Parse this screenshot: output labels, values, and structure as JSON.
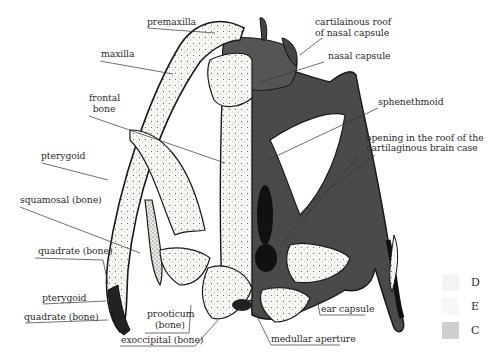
{
  "figure": {
    "type": "anatomical diagram"
  },
  "labels": {
    "premaxilla": "premaxilla",
    "maxilla": "maxilla",
    "frontal_bone_1": "frontal",
    "frontal_bone_2": "bone",
    "pterygoid_upper": "pterygoid",
    "squamosal": "squamosal (bone)",
    "quadrate_upper": "quadrate (bone)",
    "pterygoid_lower": "pterygoid",
    "quadrate_lower": "quadrate (bone)",
    "prooticum_1": "prooticum",
    "prooticum_2": "(bone)",
    "exoccipital": "exoccipital (bone)",
    "medullar_aperture": "medullar aperture",
    "ear_capsule": "ear capsule",
    "cartilaginous_roof_1": "cartilainous roof",
    "cartilaginous_roof_2": "of nasal capsule",
    "nasal_capsule": "nasal capsule",
    "sphenethmoid": "sphenethmoid",
    "opening_1": "opening in the roof of the",
    "opening_2": "cartilaginous brain case"
  },
  "legend": {
    "items": [
      {
        "label": "D",
        "color": "#f3f3f3"
      },
      {
        "label": "E",
        "color": "#f7f7f7"
      },
      {
        "label": "C",
        "color": "#cfcfcf"
      }
    ]
  },
  "colors": {
    "bone": "#f6f6f2",
    "cartilage": "#555555",
    "dark_cartilage": "#333333",
    "outline": "#1a1a1a",
    "leader": "#333333"
  }
}
